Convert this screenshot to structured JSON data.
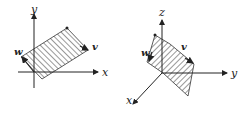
{
  "figures": [
    {
      "id": "left",
      "type": "2d-parallelogram",
      "axes": {
        "x_label": "x",
        "y_label": "y"
      },
      "vectors": {
        "v_label": "v",
        "w_label": "w"
      }
    },
    {
      "id": "right",
      "type": "3d-parallelogram",
      "axes": {
        "x_label": "x",
        "y_label": "y",
        "z_label": "z"
      },
      "vectors": {
        "v_label": "v",
        "w_label": "w"
      }
    }
  ],
  "colors": {
    "ink": "#222222",
    "background": "#ffffff"
  }
}
